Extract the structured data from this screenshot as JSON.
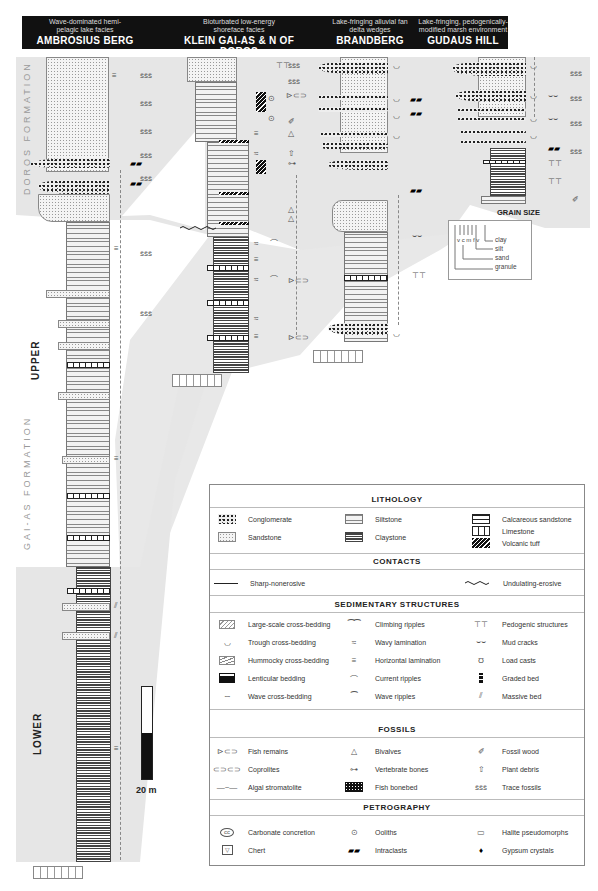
{
  "header": {
    "columns": [
      {
        "subtitle": "Wave-dominated hemi-pelagic lake facies",
        "title": "AMBROSIUS BERG"
      },
      {
        "subtitle": "Bioturbated low-energy shoreface facies",
        "title": "KLEIN GAI-AS & N OF DOROS"
      },
      {
        "subtitle": "Lake-fringing alluvial fan delta wedges",
        "title": "BRANDBERG"
      },
      {
        "subtitle": "Lake-fringing, pedogenically-modified marsh environment",
        "title": "GUDAUS HILL"
      }
    ]
  },
  "side_labels": {
    "doros_formation": "DOROS FORMATION",
    "gai_as_formation": "GAI-AS FORMATION",
    "upper": "UPPER",
    "lower": "LOWER"
  },
  "scale_bar": {
    "label": "20 m"
  },
  "grain_size": {
    "title": "GRAIN SIZE",
    "codes": "v c m f v",
    "labels": [
      "clay",
      "silt",
      "sand",
      "granule"
    ]
  },
  "legend": {
    "lithology": {
      "title": "LITHOLOGY",
      "items": [
        {
          "icon": "conglomerate-pattern",
          "label": "Conglomerate"
        },
        {
          "icon": "sandstone-pattern",
          "label": "Sandstone"
        },
        {
          "icon": "siltstone-pattern",
          "label": "Siltstone"
        },
        {
          "icon": "claystone-pattern",
          "label": "Claystone"
        },
        {
          "icon": "calcareous-sandstone-pattern",
          "label": "Calcareous sandstone"
        },
        {
          "icon": "limestone-pattern",
          "label": "Limestone"
        },
        {
          "icon": "volcanic-tuff-pattern",
          "label": "Volcanic tuff"
        }
      ]
    },
    "contacts": {
      "title": "CONTACTS",
      "items": [
        {
          "icon": "straight-line",
          "label": "Sharp-nonerosive"
        },
        {
          "icon": "wavy-line",
          "label": "Undulating-erosive"
        }
      ]
    },
    "sedimentary_structures": {
      "title": "SEDIMENTARY STRUCTURES",
      "items": [
        {
          "icon": "large-cross-bedding",
          "label": "Large-scale cross-bedding"
        },
        {
          "icon": "trough-cross-bedding",
          "label": "Trough cross-bedding"
        },
        {
          "icon": "hummocky-cross-bedding",
          "label": "Hummocky cross-bedding"
        },
        {
          "icon": "lenticular-bedding",
          "label": "Lenticular bedding"
        },
        {
          "icon": "wave-cross-bedding",
          "label": "Wave cross-bedding"
        },
        {
          "icon": "climbing-ripples",
          "label": "Climbing ripples"
        },
        {
          "icon": "wavy-lamination",
          "label": "Wavy lamination"
        },
        {
          "icon": "horizontal-lamination",
          "label": "Horizontal lamination"
        },
        {
          "icon": "current-ripples",
          "label": "Current ripples"
        },
        {
          "icon": "wave-ripples",
          "label": "Wave ripples"
        },
        {
          "icon": "pedogenic-structures",
          "label": "Pedogenic structures"
        },
        {
          "icon": "mud-cracks",
          "label": "Mud cracks"
        },
        {
          "icon": "load-casts",
          "label": "Load casts"
        },
        {
          "icon": "graded-bed",
          "label": "Graded bed"
        },
        {
          "icon": "massive-bed",
          "label": "Massive bed"
        }
      ]
    },
    "fossils": {
      "title": "FOSSILS",
      "items": [
        {
          "icon": "fish",
          "label": "Fish remains"
        },
        {
          "icon": "coprolite",
          "label": "Coprolites"
        },
        {
          "icon": "stromatolite",
          "label": "Algal stromatolite"
        },
        {
          "icon": "bivalve",
          "label": "Bivalves"
        },
        {
          "icon": "bone",
          "label": "Vertebrate bones"
        },
        {
          "icon": "bonebed",
          "label": "Fish bonebed"
        },
        {
          "icon": "wood",
          "label": "Fossil wood"
        },
        {
          "icon": "plant",
          "label": "Plant debris"
        },
        {
          "icon": "trace",
          "label": "Trace fossils"
        }
      ]
    },
    "petrography": {
      "title": "PETROGRAPHY",
      "items": [
        {
          "icon": "concretion",
          "label": "Carbonate concretion"
        },
        {
          "icon": "chert",
          "label": "Chert"
        },
        {
          "icon": "ooids",
          "label": "Ooliths"
        },
        {
          "icon": "intraclasts",
          "label": "Intraclasts"
        },
        {
          "icon": "halite",
          "label": "Halite pseudomorphs"
        },
        {
          "icon": "gypsum",
          "label": "Gypsum crystals"
        }
      ]
    }
  },
  "symbols": {
    "trace": "ššš",
    "hlam": "≡",
    "ripple": "⁀",
    "trough": "◡",
    "cc": "cc",
    "glyph_fish": "⊳⊂⊃",
    "glyph_copro": "⊂⊃⊂⊃",
    "glyph_strom": "―~―",
    "glyph_bivalve": "△",
    "glyph_bone": "⊶",
    "glyph_wood": "✐",
    "glyph_plant": "⇧",
    "glyph_trace": "ššš",
    "glyph_ooid": "⊙",
    "glyph_intra": "▰▰",
    "glyph_halite": "▭",
    "glyph_gypsum": "♦",
    "glyph_chert": "▽",
    "glyph_pedo": "⊤⊤",
    "glyph_mud": "⌣⌣",
    "glyph_load": "Ʊ",
    "glyph_massive": "⫽",
    "glyph_climb": "⁀⁀",
    "glyph_wavylam": "≈",
    "glyph_current": "⌒",
    "glyph_waveripple": "⁀",
    "glyph_wavecross": "∽",
    "glyph_trough": "◡"
  }
}
